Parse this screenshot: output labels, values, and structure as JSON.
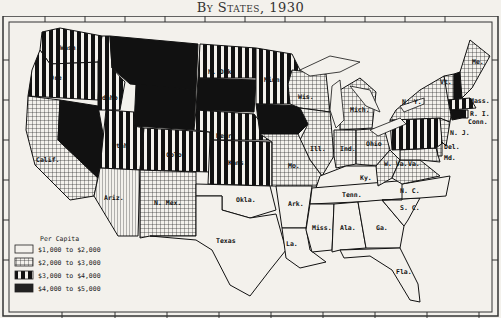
{
  "title": "By States, 1930",
  "legend": {
    "heading": "Per Capita",
    "items": [
      {
        "range": "$1,000 to $2,000",
        "pattern": "blank"
      },
      {
        "range": "$2,000 to $3,000",
        "pattern": "crosshatch"
      },
      {
        "range": "$3,000 to $4,000",
        "pattern": "vertical-stripes"
      },
      {
        "range": "$4,000 to $5,000",
        "pattern": "solid-black"
      }
    ]
  },
  "states": {
    "wash": "Wash.",
    "ore": "Ore.",
    "calif": "Calif.",
    "idaho": "Idaho",
    "nev": "Nev.",
    "mont": "Mont.",
    "wyo": "Wyo.",
    "utah": "Utah",
    "colo": "Colo.",
    "ariz": "Ariz.",
    "nmex": "N. Mex.",
    "ndak": "N. Dak.",
    "sdak": "S. Dak.",
    "nebr": "Nebr.",
    "kans": "Kans.",
    "okla": "Okla.",
    "texas": "Texas",
    "minn": "Minn.",
    "iowa": "Iowa",
    "mo": "Mo.",
    "ark": "Ark.",
    "la": "La.",
    "wis": "Wis.",
    "ill": "Ill.",
    "mich": "Mich.",
    "ind": "Ind.",
    "ohio": "Ohio",
    "ky": "Ky.",
    "tenn": "Tenn.",
    "miss": "Miss.",
    "ala": "Ala.",
    "ga": "Ga.",
    "fla": "Fla.",
    "sc": "S. C.",
    "nc": "N. C.",
    "va": "Va.",
    "wva": "W. Va.",
    "md": "Md.",
    "del": "Del.",
    "nj": "N. J.",
    "ny": "N. Y.",
    "vt": "Vt.",
    "me": "Me.",
    "mass": "Mass.",
    "ri": "R. I.",
    "conn": "Conn."
  }
}
